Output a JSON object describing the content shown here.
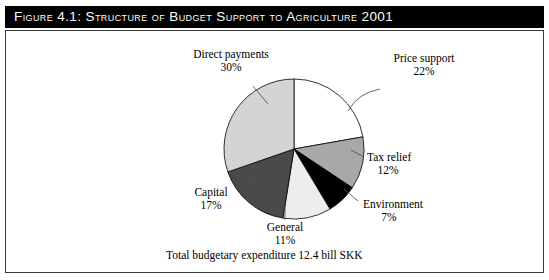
{
  "figure": {
    "title": "Figure 4.1:  Structure of Budget Support to Agriculture 2001",
    "footnote": "Total budgetary expenditure 12.4 bill SKK"
  },
  "chart_data": {
    "type": "pie",
    "title": "Figure 4.1:  Structure of Budget Support to Agriculture 2001",
    "subtitle": "",
    "annotations": [
      "Total budgetary expenditure 12.4 bill SKK"
    ],
    "total_label": "Total budgetary expenditure 12.4 bill SKK",
    "total_value": 12.4,
    "total_unit": "bill SKK",
    "units": "percent",
    "start_angle_deg": 0,
    "direction": "clockwise",
    "legend_position": "none (labels with leader lines)",
    "categories": [
      "Price support",
      "Tax relief",
      "Environment",
      "General",
      "Capital",
      "Direct payments"
    ],
    "values": [
      22,
      12,
      7,
      11,
      17,
      30
    ],
    "labels": [
      "22%",
      "12%",
      "7%",
      "11%",
      "17%",
      "30%"
    ],
    "colors": [
      "#ffffff",
      "#a8a8a8",
      "#000000",
      "#ededed",
      "#4a4a4a",
      "#d4d4d4"
    ],
    "slices": [
      {
        "name": "Price support",
        "value": 22,
        "label": "22%",
        "color": "#ffffff",
        "label_pos": "upper-right"
      },
      {
        "name": "Tax relief",
        "value": 12,
        "label": "12%",
        "color": "#a8a8a8",
        "label_pos": "right"
      },
      {
        "name": "Environment",
        "value": 7,
        "label": "7%",
        "color": "#000000",
        "label_pos": "lower-right"
      },
      {
        "name": "General",
        "value": 11,
        "label": "11%",
        "color": "#ededed",
        "label_pos": "bottom"
      },
      {
        "name": "Capital",
        "value": 17,
        "label": "17%",
        "color": "#4a4a4a",
        "label_pos": "left"
      },
      {
        "name": "Direct payments",
        "value": 30,
        "label": "30%",
        "color": "#d4d4d4",
        "label_pos": "upper-left"
      }
    ]
  },
  "labels": {
    "direct_payments_name": "Direct payments",
    "direct_payments_pct": "30%",
    "price_support_name": "Price support",
    "price_support_pct": "22%",
    "tax_relief_name": "Tax relief",
    "tax_relief_pct": "12%",
    "environment_name": "Environment",
    "environment_pct": "7%",
    "general_name": "General",
    "general_pct": "11%",
    "capital_name": "Capital",
    "capital_pct": "17%"
  }
}
